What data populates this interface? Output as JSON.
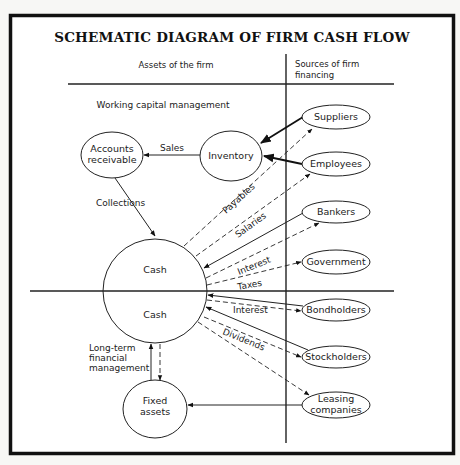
{
  "diagram": {
    "title": "SCHEMATIC DIAGRAM OF FIRM CASH FLOW",
    "columns": {
      "left": "Assets of the firm",
      "right": [
        "Sources of firm",
        "financing"
      ]
    },
    "sections": {
      "working_capital": "Working capital management",
      "long_term": [
        "Long-term",
        "financial",
        "management"
      ]
    },
    "nodes": [
      {
        "id": "accounts_receivable",
        "label": [
          "Accounts",
          "receivable"
        ],
        "cx": 112,
        "cy": 155,
        "rx": 31,
        "ry": 23
      },
      {
        "id": "inventory",
        "label": [
          "Inventory"
        ],
        "cx": 231,
        "cy": 156,
        "rx": 31,
        "ry": 25
      },
      {
        "id": "fixed_assets",
        "label": [
          "Fixed",
          "assets"
        ],
        "cx": 155,
        "cy": 409,
        "rx": 32,
        "ry": 29
      },
      {
        "id": "suppliers",
        "label": [
          "Suppliers"
        ],
        "cx": 336,
        "cy": 117,
        "rx": 34,
        "ry": 12
      },
      {
        "id": "employees",
        "label": [
          "Employees"
        ],
        "cx": 336,
        "cy": 164,
        "rx": 34,
        "ry": 12
      },
      {
        "id": "bankers",
        "label": [
          "Bankers"
        ],
        "cx": 336,
        "cy": 212,
        "rx": 34,
        "ry": 11
      },
      {
        "id": "government",
        "label": [
          "Government"
        ],
        "cx": 336,
        "cy": 262,
        "rx": 34,
        "ry": 12
      },
      {
        "id": "bondholders",
        "label": [
          "Bondholders"
        ],
        "cx": 336,
        "cy": 310,
        "rx": 34,
        "ry": 11
      },
      {
        "id": "stockholders",
        "label": [
          "Stockholders"
        ],
        "cx": 336,
        "cy": 357,
        "rx": 34,
        "ry": 11
      },
      {
        "id": "leasing_companies",
        "label": [
          "Leasing",
          "companies"
        ],
        "cx": 336,
        "cy": 405,
        "rx": 34,
        "ry": 13
      }
    ],
    "cash_circle": {
      "cx": 155,
      "cy": 291,
      "r": 52,
      "labels": [
        "Cash",
        "Cash"
      ]
    },
    "edges": [
      {
        "from": "inventory",
        "to": "accounts_receivable",
        "label": "Sales",
        "style": "solid"
      },
      {
        "from": "accounts_receivable",
        "to": "cash",
        "label": "Collections",
        "style": "solid"
      },
      {
        "from": "suppliers",
        "to": "inventory",
        "label": "",
        "style": "bold"
      },
      {
        "from": "employees",
        "to": "inventory",
        "label": "",
        "style": "bold"
      },
      {
        "from": "cash",
        "to": "suppliers",
        "label": "Payables",
        "style": "dashed"
      },
      {
        "from": "cash",
        "to": "employees",
        "label": "Salaries",
        "style": "dashed"
      },
      {
        "from": "bankers",
        "to": "cash",
        "label": "",
        "style": "solid"
      },
      {
        "from": "cash",
        "to": "bankers",
        "label": "Interest",
        "style": "dashed"
      },
      {
        "from": "cash",
        "to": "government",
        "label": "Taxes",
        "style": "dashed"
      },
      {
        "from": "bondholders",
        "to": "cash",
        "label": "",
        "style": "solid"
      },
      {
        "from": "cash",
        "to": "bondholders",
        "label": "Interest",
        "style": "dashed"
      },
      {
        "from": "stockholders",
        "to": "cash",
        "label": "",
        "style": "solid"
      },
      {
        "from": "cash",
        "to": "stockholders",
        "label": "Dividends",
        "style": "dashed"
      },
      {
        "from": "cash",
        "to": "leasing_companies",
        "label": "",
        "style": "dashed"
      },
      {
        "from": "leasing_companies",
        "to": "fixed_assets",
        "label": "",
        "style": "solid"
      },
      {
        "from": "fixed_assets",
        "to": "cash",
        "label": "",
        "style": "solid"
      },
      {
        "from": "cash",
        "to": "fixed_assets",
        "label": "",
        "style": "dashed"
      }
    ]
  }
}
